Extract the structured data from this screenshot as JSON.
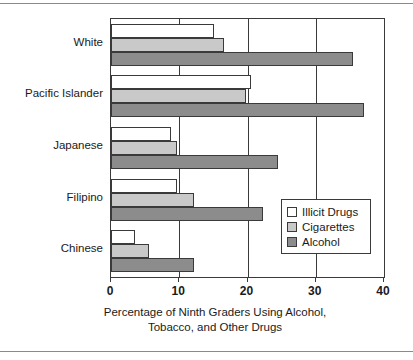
{
  "chart_data": {
    "type": "bar",
    "orientation": "horizontal",
    "title": "",
    "xlabel": "Percentage of Ninth Graders Using Alcohol, Tobacco, and Other Drugs",
    "xlabel_lines": [
      "Percentage of Ninth Graders Using Alcohol,",
      "Tobacco, and Other Drugs"
    ],
    "ylabel": "",
    "categories": [
      "White",
      "Pacific Islander",
      "Japanese",
      "Filipino",
      "Chinese"
    ],
    "series": [
      {
        "name": "Illicit Drugs",
        "color": "#ffffff",
        "values": [
          15.1,
          20.5,
          8.8,
          9.6,
          3.5
        ]
      },
      {
        "name": "Cigarettes",
        "color": "#c9c9c9",
        "values": [
          16.5,
          19.8,
          9.7,
          12.1,
          5.6
        ]
      },
      {
        "name": "Alcohol",
        "color": "#8c8c8c",
        "values": [
          35.4,
          37.0,
          24.4,
          22.3,
          12.2
        ]
      }
    ],
    "xlim": [
      0,
      40
    ],
    "xticks": [
      0,
      10,
      20,
      30,
      40
    ],
    "xtick_labels": [
      "0",
      "10",
      "20",
      "30",
      "40"
    ],
    "grid": true,
    "grid_axis": "x",
    "legend_position": "lower-right",
    "legend_entries": [
      "Illicit Drugs",
      "Cigarettes",
      "Alcohol"
    ],
    "axis_color": "#3a3a3a",
    "background": "#ffffff"
  }
}
